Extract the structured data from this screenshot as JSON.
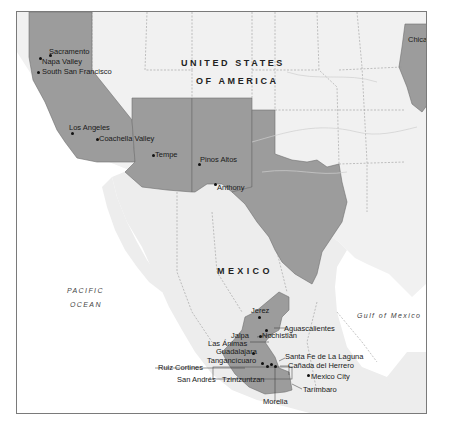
{
  "map": {
    "style": "greyscale relief",
    "highlight_color": "#9c9c9c",
    "land_color": "#f2f2f2",
    "water_color": "#ffffff",
    "border_color": "#7a7a7a",
    "countries": [
      {
        "id": "usa",
        "line1": "UNITED STATES",
        "line2": "OF AMERICA"
      },
      {
        "id": "mexico",
        "line1": "MEXICO"
      }
    ],
    "water_bodies": [
      {
        "id": "pacific",
        "line1": "PACIFIC",
        "line2": "OCEAN"
      },
      {
        "id": "gulf",
        "line1": "Gulf of Mexico"
      }
    ],
    "highlighted_regions": [
      "California",
      "Arizona",
      "New Mexico",
      "Texas",
      "Illinois",
      "Jalisco",
      "Zacatecas",
      "Aguascalientes",
      "Michoacán"
    ],
    "places": [
      {
        "name": "Sacramento"
      },
      {
        "name": "Napa Valley"
      },
      {
        "name": "South San Francisco"
      },
      {
        "name": "Los Angeles"
      },
      {
        "name": "Coachella Valley"
      },
      {
        "name": "Tempe"
      },
      {
        "name": "Pinos Altos"
      },
      {
        "name": "Anthony"
      },
      {
        "name": "Chicago"
      },
      {
        "name": "Jerez"
      },
      {
        "name": "Aguascalientes"
      },
      {
        "name": "Jalpa"
      },
      {
        "name": "Nochistlán"
      },
      {
        "name": "Las Ánimas"
      },
      {
        "name": "Guadalajara"
      },
      {
        "name": "Tangancícuaro"
      },
      {
        "name": "Santa Fe de La Laguna"
      },
      {
        "name": "Cañada del Herrero"
      },
      {
        "name": "Ruiz Cortines"
      },
      {
        "name": "San Andrés"
      },
      {
        "name": "Tzintzuntzan"
      },
      {
        "name": "Mexico City"
      },
      {
        "name": "Tarímbaro"
      },
      {
        "name": "Morelia"
      }
    ]
  }
}
